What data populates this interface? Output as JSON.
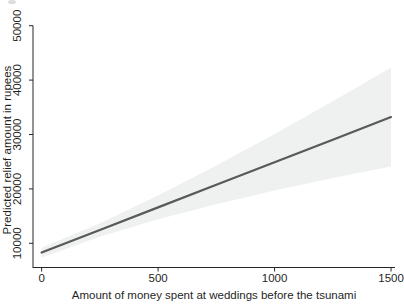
{
  "figure": {
    "background": "#ffffff",
    "axis_color": "#262626",
    "text_color": "#1f1f1f"
  },
  "chart_data": {
    "type": "line",
    "title": "",
    "xlabel": "Amount of money spent at weddings before the tsunami",
    "ylabel": "Predicted relief amount in rupees",
    "x_ticks": [
      0,
      500,
      1000,
      1500
    ],
    "y_ticks": [
      10000,
      20000,
      30000,
      40000,
      50000
    ],
    "xlim": [
      -37,
      1517
    ],
    "ylim": [
      5550,
      50000
    ],
    "grid": false,
    "legend": null,
    "series": [
      {
        "name": "predicted-relief-fit-line",
        "style": "line",
        "color": "#595959",
        "width": 2.2,
        "x": [
          0,
          250,
          500,
          750,
          1000,
          1250,
          1500
        ],
        "y": [
          8300,
          12450,
          16600,
          20750,
          24900,
          29050,
          33200
        ]
      },
      {
        "name": "confidence-band",
        "style": "band",
        "color": "#eff0f0",
        "x": [
          0,
          250,
          500,
          750,
          1000,
          1250,
          1500
        ],
        "upper": [
          9200,
          13700,
          18800,
          24300,
          30100,
          36100,
          42300
        ],
        "lower": [
          7400,
          11200,
          14400,
          17200,
          19700,
          22000,
          24100
        ]
      }
    ]
  }
}
